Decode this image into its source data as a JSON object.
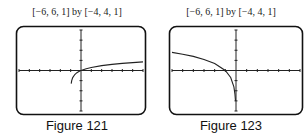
{
  "chart_data": [
    {
      "type": "line",
      "title": "[−6, 6, 1] by [−4, 4, 1]",
      "caption": "Figure 121",
      "xlim": [
        -6,
        6
      ],
      "xscale": 1,
      "ylim": [
        -4,
        4
      ],
      "yscale": 1,
      "grid": false,
      "function": "log10(x+1)",
      "x": [
        -0.95,
        -0.9,
        -0.8,
        -0.6,
        -0.4,
        -0.2,
        0,
        0.5,
        1,
        2,
        3,
        4,
        5,
        6
      ],
      "y": [
        -1.3,
        -1.0,
        -0.7,
        -0.4,
        -0.22,
        -0.1,
        0,
        0.18,
        0.3,
        0.48,
        0.6,
        0.7,
        0.78,
        0.85
      ]
    },
    {
      "type": "line",
      "title": "[−6, 6, 1] by [−4, 4, 1]",
      "caption": "Figure 123",
      "xlim": [
        -6,
        6
      ],
      "xscale": 1,
      "ylim": [
        -4,
        4
      ],
      "yscale": 1,
      "grid": false,
      "function": "ln(-x)",
      "x": [
        -6,
        -5,
        -4,
        -3,
        -2,
        -1,
        -0.5,
        -0.2,
        -0.1,
        -0.05
      ],
      "y": [
        1.79,
        1.61,
        1.39,
        1.1,
        0.69,
        0,
        -0.69,
        -1.61,
        -2.3,
        -3.0
      ]
    }
  ],
  "figures": [
    {
      "window": "[−6, 6, 1] by [−4, 4, 1]",
      "caption": "Figure 121"
    },
    {
      "window": "[−6, 6, 1] by [−4, 4, 1]",
      "caption": "Figure 123"
    }
  ]
}
